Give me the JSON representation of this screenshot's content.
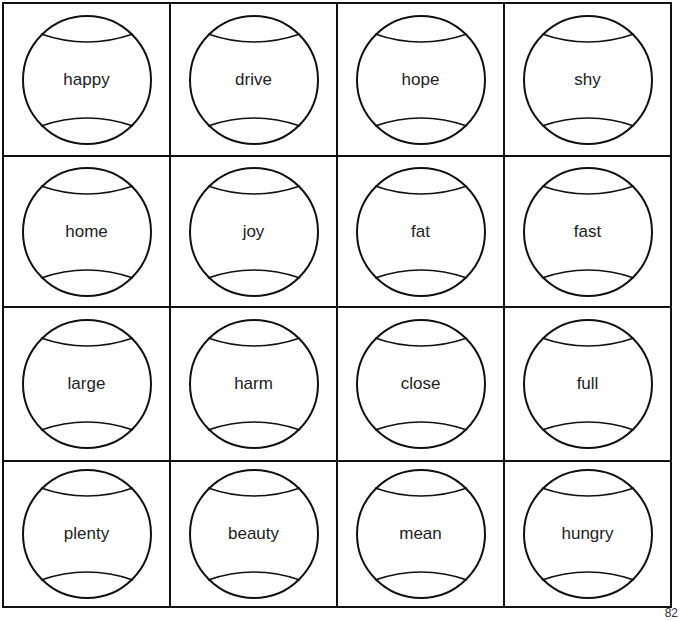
{
  "worksheet": {
    "words": [
      [
        "happy",
        "drive",
        "hope",
        "shy"
      ],
      [
        "home",
        "joy",
        "fat",
        "fast"
      ],
      [
        "large",
        "harm",
        "close",
        "full"
      ],
      [
        "plenty",
        "beauty",
        "mean",
        "hungry"
      ]
    ],
    "page_number": "82"
  }
}
